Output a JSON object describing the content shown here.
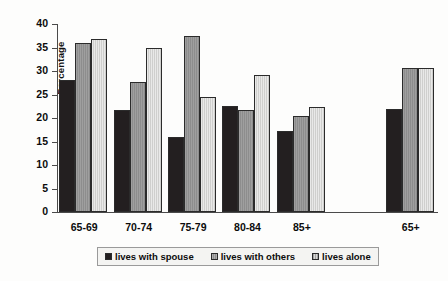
{
  "chart_data": {
    "type": "bar",
    "title": "",
    "xlabel": "",
    "ylabel": "Percentage",
    "ylim": [
      0,
      40
    ],
    "yticks": [
      0,
      5,
      10,
      15,
      20,
      25,
      30,
      35,
      40
    ],
    "grid": false,
    "legend_position": "bottom",
    "categories": [
      "65-69",
      "70-74",
      "75-79",
      "80-84",
      "85+",
      "",
      "65+"
    ],
    "series": [
      {
        "name": "lives with spouse",
        "color": "#231f20",
        "values": [
          28.0,
          21.8,
          16.0,
          22.5,
          17.3,
          null,
          22.0
        ]
      },
      {
        "name": "lives with others",
        "color": "#8d8d8d",
        "values": [
          36.0,
          27.7,
          37.5,
          21.7,
          20.4,
          null,
          30.7
        ]
      },
      {
        "name": "lives alone",
        "color": "#cfcfcd",
        "values": [
          36.8,
          34.8,
          24.5,
          29.2,
          22.4,
          null,
          30.7
        ]
      }
    ]
  }
}
